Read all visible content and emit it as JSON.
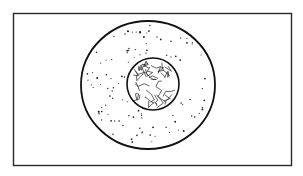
{
  "figure": {
    "frame": {
      "x": 13,
      "y": 13,
      "width": 278,
      "height": 153,
      "stroke": "#2a2a2a"
    },
    "cell_membrane": {
      "cx": 148,
      "cy": 85,
      "rx": 67,
      "ry": 64,
      "stroke": "#111111"
    },
    "nucleus": {
      "cx": 153,
      "cy": 84,
      "r": 26,
      "stroke": "#111111"
    },
    "ink_color": "#111111",
    "background": "#ffffff"
  }
}
